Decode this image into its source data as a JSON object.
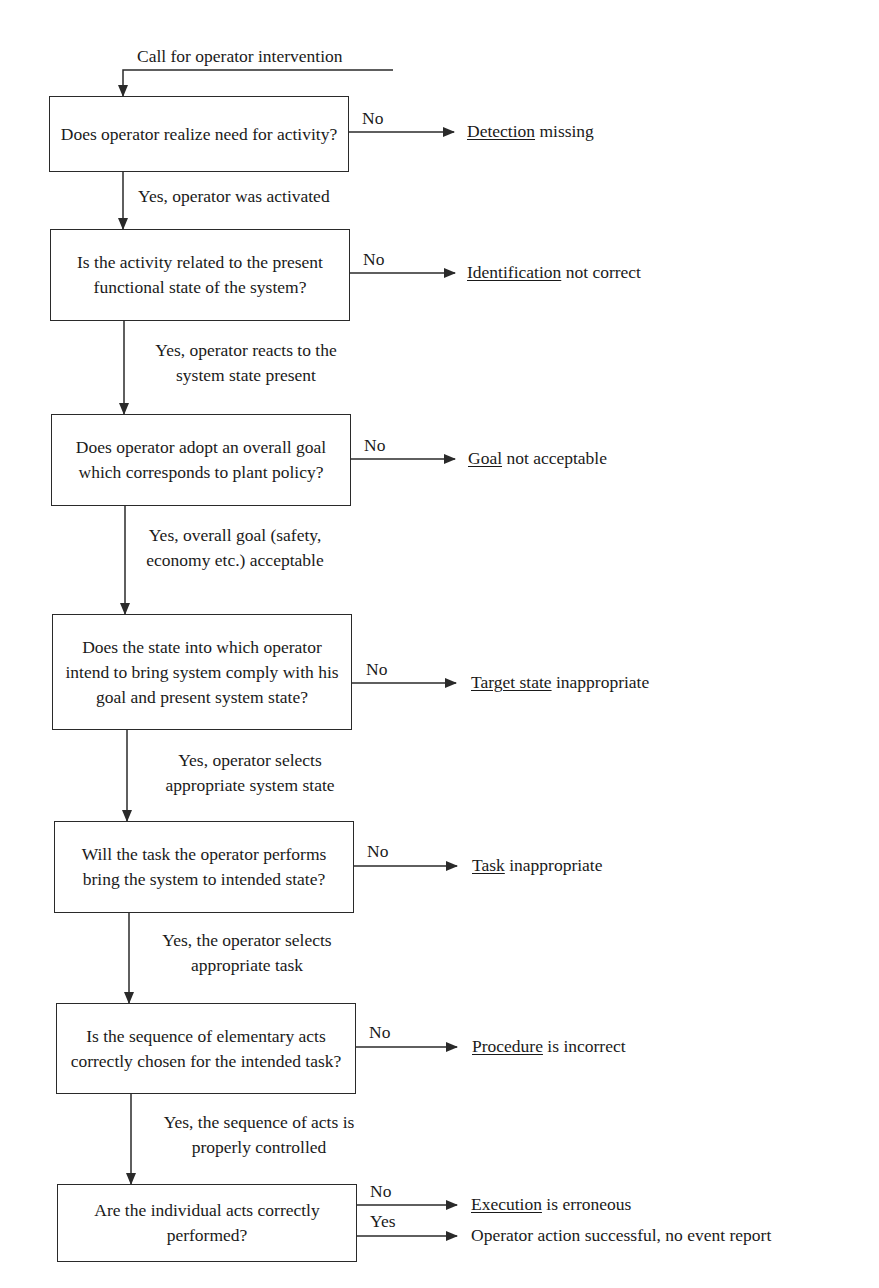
{
  "diagram": {
    "entry_label": "Call for operator intervention",
    "colors": {
      "line": "#2a2a2a",
      "text": "#1a1a1a",
      "background": "#ffffff"
    },
    "steps": [
      {
        "question": "Does operator realize need for activity?",
        "no_label": "No",
        "outcome_keyword": "Detection",
        "outcome_rest": " missing",
        "yes_label": "Yes, operator was activated"
      },
      {
        "question": "Is the activity related to the present functional state of the system?",
        "no_label": "No",
        "outcome_keyword": "Identification",
        "outcome_rest": " not correct",
        "yes_label": "Yes, operator reacts to the system state present"
      },
      {
        "question": "Does operator adopt an overall goal which corresponds to plant policy?",
        "no_label": "No",
        "outcome_keyword": "Goal",
        "outcome_rest": " not acceptable",
        "yes_label": "Yes, overall goal (safety, economy etc.) acceptable"
      },
      {
        "question": "Does the state into which operator intend to bring system comply with his goal and present system state?",
        "no_label": "No",
        "outcome_keyword": "Target state",
        "outcome_rest": " inappropriate",
        "yes_label": "Yes, operator selects appropriate system state"
      },
      {
        "question": "Will the task the operator performs bring the system to intended state?",
        "no_label": "No",
        "outcome_keyword": "Task",
        "outcome_rest": " inappropriate",
        "yes_label": "Yes, the operator selects appropriate task"
      },
      {
        "question": "Is the sequence of elementary acts correctly chosen for the intended task?",
        "no_label": "No",
        "outcome_keyword": "Procedure",
        "outcome_rest": " is incorrect",
        "yes_label": "Yes, the sequence of acts is properly controlled"
      },
      {
        "question": "Are the individual acts correctly performed?",
        "no_label": "No",
        "outcome_keyword": "Execution",
        "outcome_rest": " is erroneous",
        "yes_label": "Yes",
        "success_outcome": "Operator action successful, no event report"
      }
    ]
  }
}
